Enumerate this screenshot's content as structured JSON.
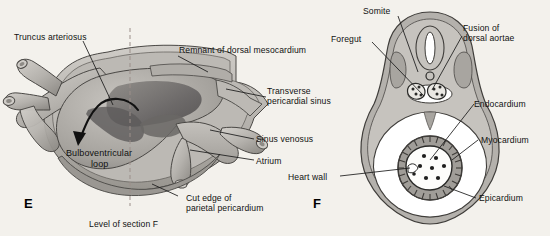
{
  "figure": {
    "background_color": "#f3f1ec",
    "text_color": "#111111",
    "leader_line_color": "#1a1a1a"
  },
  "panels": [
    {
      "id": "E",
      "letter": "E",
      "caption": "Level of section F"
    },
    {
      "id": "F",
      "letter": "F"
    }
  ],
  "labels": {
    "truncus_arteriosus": "Truncus arteriosus",
    "remnant_dorsal_mesocardium": "Remnant of dorsal mesocardium",
    "transverse_pericardial_sinus_l1": "Transverse",
    "transverse_pericardial_sinus_l2": "pericardial sinus",
    "sinus_venosus": "Sinus venosus",
    "atrium": "Atrium",
    "cut_edge_l1": "Cut edge of",
    "cut_edge_l2": "parietal pericardium",
    "bulboventricular_l1": "Bulboventricular",
    "bulboventricular_l2": "loop",
    "level_of_section_f": "Level of section F",
    "somite": "Somite",
    "foregut": "Foregut",
    "fusion_dorsal_aortae_l1": "Fusion of",
    "fusion_dorsal_aortae_l2": "dorsal aortae",
    "endocardium": "Endocardium",
    "myocardium": "Myocardium",
    "epicardium": "Epicardium",
    "heart_wall": "Heart wall",
    "panel_e_letter": "E",
    "panel_f_letter": "F"
  },
  "anatomy_colors": {
    "pericardium_outer": "#b9b6b1",
    "pericardium_mid": "#a8a5a0",
    "heart_tube_light": "#c6c3be",
    "heart_tube_mid": "#aeaba6",
    "heart_tube_dark": "#6e6b68",
    "cavity_white": "#ffffff",
    "outline": "#4a4845",
    "myocardium_fill": "#a09d98",
    "endocardium_white": "#fdfdfb",
    "speckle": "#2a2a28"
  },
  "structures_panel_e": [
    "truncus arteriosus",
    "aortic arch branches",
    "bulboventricular loop",
    "dorsal mesocardium remnant",
    "transverse pericardial sinus",
    "sinus venosus",
    "atrium",
    "parietal pericardium cut edge",
    "looping arrow"
  ],
  "structures_panel_f": [
    "neural tube",
    "notochord",
    "fused dorsal aortae",
    "somite",
    "foregut",
    "pericardial cavity",
    "heart wall",
    "endocardium",
    "myocardium",
    "epicardium"
  ]
}
